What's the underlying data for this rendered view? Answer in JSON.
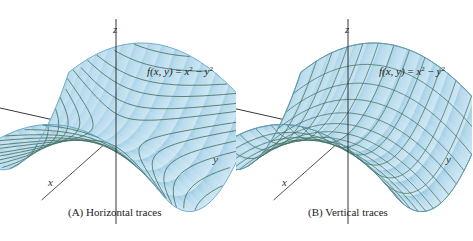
{
  "figure": {
    "function_label": {
      "lhs": "f(x, y)",
      "equals": " = ",
      "term1_base": "x",
      "term1_exp": "2",
      "minus": " − ",
      "term2_base": "y",
      "term2_exp": "2"
    },
    "axes": {
      "x": "x",
      "y": "y",
      "z": "z"
    },
    "colors": {
      "surface_fill": "#b8dbed",
      "surface_dark": "#8fc4de",
      "surface_edge": "#5a9fc0",
      "trace_line": "#3f6b5a",
      "axis_line": "#222222"
    },
    "panels": [
      {
        "id": "A",
        "caption": "(A)  Horizontal traces",
        "trace_type": "horizontal"
      },
      {
        "id": "B",
        "caption": "(B)  Vertical traces",
        "trace_type": "vertical"
      }
    ]
  }
}
